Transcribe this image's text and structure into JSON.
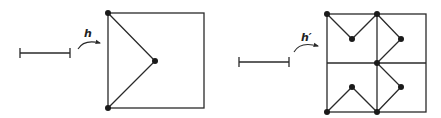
{
  "figure": {
    "colors": {
      "line": "#2a2a2a",
      "vertex": "#1a1a1a",
      "background": "#ffffff"
    },
    "panels": [
      {
        "name": "left",
        "map_label": "h",
        "segment": {
          "x1": 20,
          "x2": 70,
          "y": 53
        },
        "arrow": {
          "from": [
            78,
            48
          ],
          "to": [
            100,
            42
          ]
        },
        "square": {
          "x": 108,
          "y": 13,
          "size": 96
        },
        "polyline": [
          [
            108,
            13
          ],
          [
            155,
            61
          ],
          [
            108,
            108
          ]
        ],
        "vertices": [
          [
            108,
            13
          ],
          [
            155,
            61
          ],
          [
            108,
            108
          ]
        ]
      },
      {
        "name": "right",
        "map_label": "h′",
        "segment": {
          "x1": 239,
          "x2": 289,
          "y": 62
        },
        "arrow": {
          "from": [
            294,
            51
          ],
          "to": [
            318,
            46
          ]
        },
        "square": {
          "x": 327,
          "y": 14,
          "size": 98
        },
        "grid_mid": {
          "x": 377,
          "y": 63
        },
        "polylines": [
          [
            [
              327,
              14
            ],
            [
              352,
              39
            ],
            [
              377,
              14
            ],
            [
              401,
              39
            ],
            [
              377,
              63
            ],
            [
              401,
              87
            ],
            [
              377,
              112
            ],
            [
              352,
              87
            ],
            [
              327,
              112
            ]
          ]
        ],
        "vertices": [
          [
            327,
            14
          ],
          [
            352,
            39
          ],
          [
            377,
            14
          ],
          [
            401,
            39
          ],
          [
            377,
            63
          ],
          [
            401,
            87
          ],
          [
            377,
            112
          ],
          [
            352,
            87
          ],
          [
            327,
            112
          ]
        ]
      }
    ]
  }
}
